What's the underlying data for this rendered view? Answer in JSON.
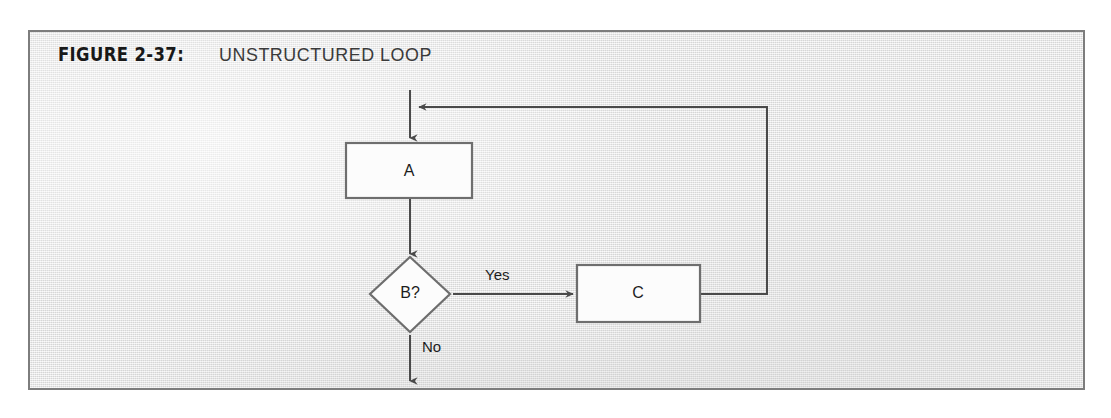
{
  "figure": {
    "number": "FIGURE 2-37:",
    "title": "UNSTRUCTURED LOOP"
  },
  "colors": {
    "page_background": "#ffffff",
    "paper": "#e9e9e9",
    "frame_border": "#7d7d7d",
    "node_fill": "#fcfcfc",
    "node_border": "#6e6e6e",
    "edge": "#4a4a4a",
    "text": "#1d1d1d"
  },
  "diagram": {
    "type": "flowchart",
    "nodes": [
      {
        "id": "A",
        "shape": "process",
        "label": "A"
      },
      {
        "id": "B",
        "shape": "decision",
        "label": "B?"
      },
      {
        "id": "C",
        "shape": "process",
        "label": "C"
      }
    ],
    "edges": [
      {
        "from": "entry",
        "to": "A",
        "label": ""
      },
      {
        "from": "A",
        "to": "B",
        "label": ""
      },
      {
        "from": "B",
        "to": "C",
        "label": "Yes"
      },
      {
        "from": "B",
        "to": "exit",
        "label": "No"
      },
      {
        "from": "C",
        "to": "entry",
        "label": ""
      }
    ],
    "edge_labels": {
      "yes": "Yes",
      "no": "No"
    }
  }
}
